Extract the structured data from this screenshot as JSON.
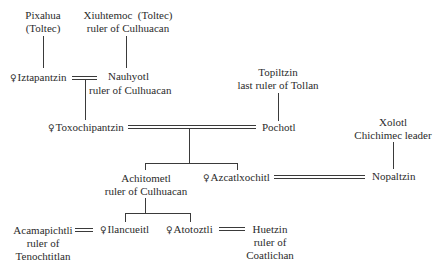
{
  "diagram": {
    "type": "genealogy-tree",
    "female_symbol": "♀",
    "people": {
      "pixahua": {
        "name": "Pixahua",
        "note": "(Toltec)",
        "female": false
      },
      "xiuhtemoc": {
        "name": "Xiuhtemoc",
        "tag": "(Toltec)",
        "note": "ruler of Culhuacan",
        "female": false
      },
      "iztapantzin": {
        "name": "Iztapantzin",
        "female": true
      },
      "nauhyotl": {
        "name": "Nauhyotl",
        "note": "ruler of Culhuacan",
        "female": false
      },
      "topiltzin": {
        "name": "Topiltzin",
        "note": "last ruler of Tollan",
        "female": false
      },
      "toxochipantzin": {
        "name": "Toxochipantzin",
        "female": true
      },
      "pochotl": {
        "name": "Pochotl",
        "female": false
      },
      "xolotl": {
        "name": "Xolotl",
        "note": "Chichimec leader",
        "female": false
      },
      "achitometl": {
        "name": "Achitometl",
        "note": "ruler of Culhuacan",
        "female": false
      },
      "azcatlxochitl": {
        "name": "Azcatlxochitl",
        "female": true
      },
      "nopaltzin": {
        "name": "Nopaltzin",
        "female": false
      },
      "acamapichtli": {
        "name": "Acamapichtli",
        "note1": "ruler of",
        "note2": "Tenochtitlan",
        "female": false
      },
      "ilancueitl": {
        "name": "Ilancueitl",
        "female": true
      },
      "atotoztli": {
        "name": "Atotoztli",
        "female": true
      },
      "huetzin": {
        "name": "Huetzin",
        "note1": "ruler of",
        "note2": "Coatlichan",
        "female": false
      }
    },
    "marriages": [
      [
        "Iztapantzin",
        "Nauhyotl"
      ],
      [
        "Toxochipantzin",
        "Pochotl"
      ],
      [
        "Azcatlxochitl",
        "Nopaltzin"
      ],
      [
        "Acamapichtli",
        "Ilancueitl"
      ],
      [
        "Atotoztli",
        "Huetzin"
      ]
    ],
    "descent": [
      {
        "parent": "Pixahua",
        "child": "Iztapantzin"
      },
      {
        "parent": "Xiuhtemoc",
        "child": "Nauhyotl"
      },
      {
        "parents": [
          "Iztapantzin",
          "Nauhyotl"
        ],
        "child": "Toxochipantzin"
      },
      {
        "parent": "Topiltzin",
        "child": "Pochotl"
      },
      {
        "parents": [
          "Toxochipantzin",
          "Pochotl"
        ],
        "children": [
          "Achitometl",
          "Azcatlxochitl"
        ]
      },
      {
        "parent": "Xolotl",
        "child": "Nopaltzin"
      },
      {
        "parent": "Achitometl",
        "children": [
          "Ilancueitl",
          "Atotoztli"
        ]
      }
    ]
  }
}
